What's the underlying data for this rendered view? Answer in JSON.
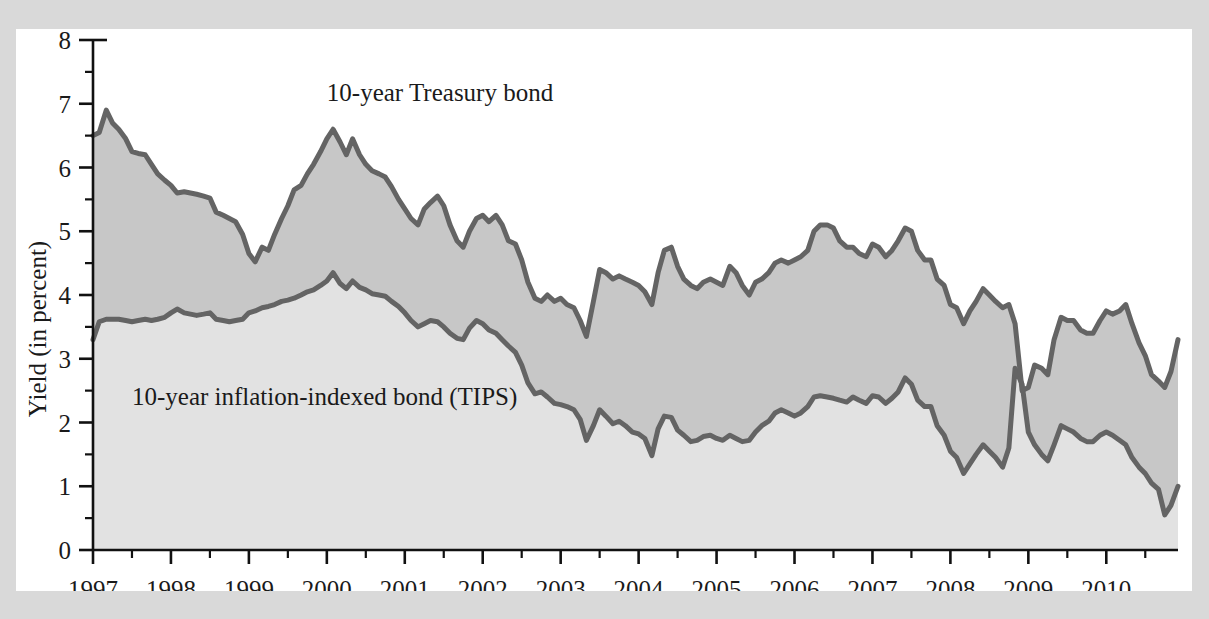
{
  "figure": {
    "background": "#ffffff",
    "page_background": "#d9d9d9"
  },
  "chart_data": {
    "type": "line",
    "title": "",
    "xlabel": "",
    "ylabel": "Yield (in percent)",
    "xlim": [
      1997.0,
      2010.92
    ],
    "ylim": [
      0,
      8
    ],
    "grid": false,
    "legend_position": "inline-annotations",
    "colors": {
      "line": "#646464",
      "band_between": "#c7c7c7",
      "band_below": "#e2e2e2",
      "axis": "#111111",
      "text": "#1a1a1a"
    },
    "y_ticks": [
      0,
      1,
      2,
      3,
      4,
      5,
      6,
      7,
      8
    ],
    "y_tick_labels": [
      "0",
      "1",
      "2",
      "3",
      "4",
      "5",
      "6",
      "7",
      "8"
    ],
    "y_minor_ticks": [
      0.5,
      1.5,
      2.5,
      3.5,
      4.5,
      5.5,
      6.5,
      7.5
    ],
    "x_ticks": [
      1997,
      1998,
      1999,
      2000,
      2001,
      2002,
      2003,
      2004,
      2005,
      2006,
      2007,
      2008,
      2009,
      2010
    ],
    "x_tick_labels": [
      "1997",
      "1998",
      "1999",
      "2000",
      "2001",
      "2002",
      "2003",
      "2004",
      "2005",
      "2006",
      "2007",
      "2008",
      "2009",
      "2010"
    ],
    "x_minor_ticks": [
      1997.5,
      1998.5,
      1999.5,
      2000.5,
      2001.5,
      2002.5,
      2003.5,
      2004.5,
      2005.5,
      2006.5,
      2007.5,
      2008.5,
      2009.5,
      2010.5
    ],
    "annotations": [
      {
        "name": "treasury-label",
        "text": "10-year Treasury bond",
        "x": 2000.0,
        "y": 7.05
      },
      {
        "name": "tips-label",
        "text": "10-year inflation-indexed bond (TIPS)",
        "x": 1997.5,
        "y": 2.28
      }
    ],
    "x": [
      1997.0,
      1997.08,
      1997.17,
      1997.25,
      1997.33,
      1997.42,
      1997.5,
      1997.58,
      1997.67,
      1997.75,
      1997.83,
      1997.92,
      1998.0,
      1998.08,
      1998.17,
      1998.25,
      1998.33,
      1998.42,
      1998.5,
      1998.58,
      1998.67,
      1998.75,
      1998.83,
      1998.92,
      1999.0,
      1999.08,
      1999.17,
      1999.25,
      1999.33,
      1999.42,
      1999.5,
      1999.58,
      1999.67,
      1999.75,
      1999.83,
      1999.92,
      2000.0,
      2000.08,
      2000.17,
      2000.25,
      2000.33,
      2000.42,
      2000.5,
      2000.58,
      2000.67,
      2000.75,
      2000.83,
      2000.92,
      2001.0,
      2001.08,
      2001.17,
      2001.25,
      2001.33,
      2001.42,
      2001.5,
      2001.58,
      2001.67,
      2001.75,
      2001.83,
      2001.92,
      2002.0,
      2002.08,
      2002.17,
      2002.25,
      2002.33,
      2002.42,
      2002.5,
      2002.58,
      2002.67,
      2002.75,
      2002.83,
      2002.92,
      2003.0,
      2003.08,
      2003.17,
      2003.25,
      2003.33,
      2003.42,
      2003.5,
      2003.58,
      2003.67,
      2003.75,
      2003.83,
      2003.92,
      2004.0,
      2004.08,
      2004.17,
      2004.25,
      2004.33,
      2004.42,
      2004.5,
      2004.58,
      2004.67,
      2004.75,
      2004.83,
      2004.92,
      2005.0,
      2005.08,
      2005.17,
      2005.25,
      2005.33,
      2005.42,
      2005.5,
      2005.58,
      2005.67,
      2005.75,
      2005.83,
      2005.92,
      2006.0,
      2006.08,
      2006.17,
      2006.25,
      2006.33,
      2006.42,
      2006.5,
      2006.58,
      2006.67,
      2006.75,
      2006.83,
      2006.92,
      2007.0,
      2007.08,
      2007.17,
      2007.25,
      2007.33,
      2007.42,
      2007.5,
      2007.58,
      2007.67,
      2007.75,
      2007.83,
      2007.92,
      2008.0,
      2008.08,
      2008.17,
      2008.25,
      2008.33,
      2008.42,
      2008.5,
      2008.58,
      2008.67,
      2008.75,
      2008.83,
      2008.92,
      2009.0,
      2009.08,
      2009.17,
      2009.25,
      2009.33,
      2009.42,
      2009.5,
      2009.58,
      2009.67,
      2009.75,
      2009.83,
      2009.92,
      2010.0,
      2010.08,
      2010.17,
      2010.25,
      2010.33,
      2010.42,
      2010.5,
      2010.58,
      2010.67,
      2010.75,
      2010.83,
      2010.92
    ],
    "series": [
      {
        "name": "10-year Treasury bond",
        "color": "#646464",
        "values": [
          6.5,
          6.55,
          6.9,
          6.7,
          6.6,
          6.45,
          6.25,
          6.22,
          6.2,
          6.05,
          5.9,
          5.8,
          5.72,
          5.6,
          5.62,
          5.6,
          5.58,
          5.55,
          5.52,
          5.3,
          5.25,
          5.2,
          5.15,
          4.95,
          4.65,
          4.52,
          4.75,
          4.7,
          4.95,
          5.2,
          5.4,
          5.65,
          5.72,
          5.9,
          6.05,
          6.25,
          6.45,
          6.6,
          6.4,
          6.2,
          6.45,
          6.2,
          6.05,
          5.95,
          5.9,
          5.85,
          5.7,
          5.5,
          5.35,
          5.2,
          5.1,
          5.35,
          5.45,
          5.55,
          5.4,
          5.1,
          4.85,
          4.75,
          5.0,
          5.2,
          5.25,
          5.15,
          5.25,
          5.1,
          4.85,
          4.8,
          4.55,
          4.2,
          3.95,
          3.9,
          4.0,
          3.9,
          3.95,
          3.85,
          3.8,
          3.6,
          3.35,
          3.9,
          4.4,
          4.35,
          4.25,
          4.3,
          4.25,
          4.2,
          4.15,
          4.05,
          3.85,
          4.35,
          4.7,
          4.75,
          4.45,
          4.25,
          4.15,
          4.1,
          4.2,
          4.25,
          4.2,
          4.15,
          4.45,
          4.35,
          4.15,
          4.0,
          4.2,
          4.25,
          4.35,
          4.5,
          4.55,
          4.5,
          4.55,
          4.6,
          4.7,
          5.0,
          5.1,
          5.1,
          5.05,
          4.85,
          4.75,
          4.75,
          4.65,
          4.6,
          4.8,
          4.75,
          4.6,
          4.7,
          4.85,
          5.05,
          5.0,
          4.7,
          4.55,
          4.55,
          4.25,
          4.15,
          3.85,
          3.8,
          3.55,
          3.75,
          3.9,
          4.1,
          4.0,
          3.9,
          3.8,
          3.85,
          3.55,
          2.5,
          2.55,
          2.9,
          2.85,
          2.75,
          3.3,
          3.65,
          3.6,
          3.6,
          3.45,
          3.4,
          3.4,
          3.6,
          3.75,
          3.7,
          3.75,
          3.85,
          3.55,
          3.25,
          3.05,
          2.75,
          2.65,
          2.55,
          2.8,
          3.3
        ]
      },
      {
        "name": "10-year inflation-indexed bond (TIPS)",
        "color": "#646464",
        "values": [
          3.3,
          3.58,
          3.62,
          3.62,
          3.62,
          3.6,
          3.58,
          3.6,
          3.62,
          3.6,
          3.62,
          3.65,
          3.72,
          3.78,
          3.72,
          3.7,
          3.68,
          3.7,
          3.72,
          3.62,
          3.6,
          3.58,
          3.6,
          3.62,
          3.72,
          3.75,
          3.8,
          3.82,
          3.85,
          3.9,
          3.92,
          3.95,
          4.0,
          4.05,
          4.08,
          4.15,
          4.22,
          4.35,
          4.18,
          4.1,
          4.22,
          4.12,
          4.08,
          4.02,
          4.0,
          3.98,
          3.9,
          3.82,
          3.72,
          3.6,
          3.5,
          3.55,
          3.6,
          3.58,
          3.5,
          3.4,
          3.32,
          3.3,
          3.48,
          3.6,
          3.55,
          3.45,
          3.4,
          3.3,
          3.2,
          3.1,
          2.9,
          2.62,
          2.45,
          2.48,
          2.4,
          2.3,
          2.28,
          2.25,
          2.2,
          2.05,
          1.72,
          1.95,
          2.2,
          2.1,
          1.98,
          2.02,
          1.95,
          1.85,
          1.82,
          1.75,
          1.48,
          1.9,
          2.1,
          2.08,
          1.88,
          1.8,
          1.7,
          1.72,
          1.78,
          1.8,
          1.75,
          1.72,
          1.8,
          1.75,
          1.7,
          1.72,
          1.85,
          1.95,
          2.02,
          2.15,
          2.2,
          2.15,
          2.1,
          2.15,
          2.25,
          2.4,
          2.42,
          2.4,
          2.38,
          2.35,
          2.32,
          2.4,
          2.35,
          2.3,
          2.42,
          2.4,
          2.3,
          2.38,
          2.48,
          2.7,
          2.6,
          2.35,
          2.25,
          2.25,
          1.95,
          1.8,
          1.55,
          1.45,
          1.2,
          1.35,
          1.5,
          1.65,
          1.55,
          1.45,
          1.3,
          1.6,
          2.85,
          2.6,
          1.85,
          1.65,
          1.5,
          1.4,
          1.65,
          1.95,
          1.9,
          1.85,
          1.75,
          1.7,
          1.7,
          1.8,
          1.85,
          1.8,
          1.72,
          1.65,
          1.45,
          1.3,
          1.2,
          1.05,
          0.95,
          0.55,
          0.7,
          1.0
        ]
      }
    ]
  }
}
